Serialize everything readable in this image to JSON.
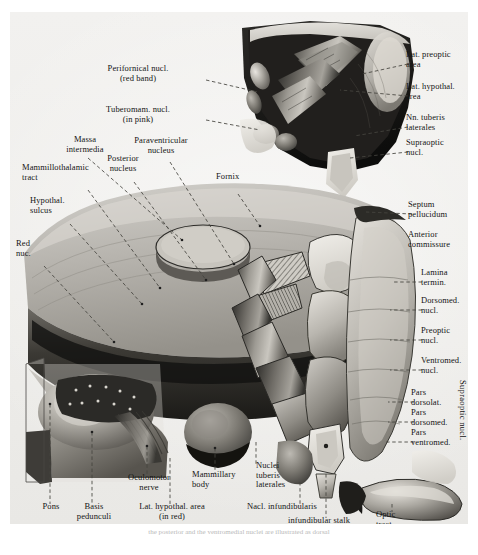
{
  "figure": {
    "type": "anatomical-illustration",
    "rendering": "grayscale halftone",
    "background_color": "#efeeec",
    "ink_color": "#141414",
    "leader_line_color": "#4c4c4c"
  },
  "labels": {
    "top_left_group": [
      {
        "id": "perifornical-nucl",
        "text": "Perifornical nucl.\n(red band)",
        "align": "center",
        "x": 128,
        "y": 62
      },
      {
        "id": "tuberomam-nucl",
        "text": "Tuberomam. nucl.\n(in pink)",
        "align": "center",
        "x": 128,
        "y": 103
      },
      {
        "id": "massa-intermedia",
        "text": "Massa\nintermedia",
        "align": "center",
        "x": 75,
        "y": 133
      },
      {
        "id": "paraventricular-nucleus",
        "text": "Paraventricular\nnucleus",
        "align": "center",
        "x": 151,
        "y": 134
      },
      {
        "id": "posterior-nucleus",
        "text": "Posterior\nnucleus",
        "align": "center",
        "x": 113,
        "y": 152
      },
      {
        "id": "mammillothalamic-tract",
        "text": "Mammillothalamic\ntract",
        "align": "left",
        "x": 22,
        "y": 161
      },
      {
        "id": "fornix",
        "text": "Fornix",
        "align": "left",
        "x": 216,
        "y": 170
      },
      {
        "id": "hypothal-sulcus",
        "text": "Hypothal.\nsulcus",
        "align": "left",
        "x": 30,
        "y": 194
      },
      {
        "id": "red-nucl",
        "text": "Red\nnuc.",
        "align": "left",
        "x": 14,
        "y": 237
      }
    ],
    "top_right_group": [
      {
        "id": "lat-preoptic-area",
        "text": "Lat. preoptic\narea",
        "align": "left",
        "x": 403,
        "y": 48
      },
      {
        "id": "lat-hypothal-area",
        "text": "Lat. hypothal.\narea",
        "align": "left",
        "x": 403,
        "y": 80
      },
      {
        "id": "nn-tuberis-laterales",
        "text": "Nn. tuberis\nlaterales",
        "align": "left",
        "x": 403,
        "y": 111
      },
      {
        "id": "supraoptic-nucl",
        "text": "Supraoptic\nnucl.",
        "align": "left",
        "x": 403,
        "y": 136
      }
    ],
    "right_group": [
      {
        "id": "septum-pellucidum",
        "text": "Septum\npellucidum",
        "align": "left",
        "x": 405,
        "y": 198
      },
      {
        "id": "anterior-commissure",
        "text": "Anterior\ncommissure",
        "align": "left",
        "x": 405,
        "y": 228
      },
      {
        "id": "lamina-termin",
        "text": "Lamina\ntermin.",
        "align": "left",
        "x": 418,
        "y": 266
      },
      {
        "id": "dorsomed-nucl",
        "text": "Dorsomed.\nnucl.",
        "align": "left",
        "x": 418,
        "y": 293
      },
      {
        "id": "preoptic-nucl",
        "text": "Preoptic\nnucl.",
        "align": "left",
        "x": 418,
        "y": 323
      },
      {
        "id": "ventromed-nucl",
        "text": "Ventromed.\nnucl.",
        "align": "left",
        "x": 418,
        "y": 354
      }
    ],
    "lower_right_group": [
      {
        "id": "pars-dorsolat",
        "text": "Pars\ndorsolat.",
        "align": "left",
        "x": 408,
        "y": 386
      },
      {
        "id": "pars-dorsomed",
        "text": "Pars\ndorsomed.",
        "align": "left",
        "x": 408,
        "y": 406
      },
      {
        "id": "pars-ventromed",
        "text": "Pars\nventromed.",
        "align": "left",
        "x": 408,
        "y": 426
      },
      {
        "id": "supraoptic-nucl-vertical",
        "text": "Supraoptic nucl.",
        "orientation": "vertical",
        "x": 464,
        "y": 378
      }
    ],
    "bottom_group": [
      {
        "id": "pons",
        "text": "Pons",
        "align": "center",
        "x": 40,
        "y": 500
      },
      {
        "id": "basis-pedunculi",
        "text": "Basis\npedunculi",
        "align": "center",
        "x": 81,
        "y": 500
      },
      {
        "id": "oculomotor-nerve",
        "text": "Oculomotor\nnerve",
        "align": "center",
        "x": 137,
        "y": 471
      },
      {
        "id": "mammillary-body",
        "text": "Mammillary\nbody",
        "align": "center",
        "x": 205,
        "y": 468
      },
      {
        "id": "lat-hypothal-area-red",
        "text": "Lat. hypothal. area\n(in red)",
        "align": "center",
        "x": 160,
        "y": 500
      },
      {
        "id": "nuclei-tuberis-laterales",
        "text": "Nuclei\ntuberis\nlaterales",
        "align": "left",
        "x": 253,
        "y": 459
      },
      {
        "id": "nucl-infundibularis",
        "text": "Nacl. infundibularis",
        "align": "left",
        "x": 247,
        "y": 500
      },
      {
        "id": "infundibular-stalk",
        "text": "infundibular stalk",
        "align": "left",
        "x": 288,
        "y": 514
      },
      {
        "id": "optic-tract",
        "text": "Optic\ntract",
        "align": "left",
        "x": 376,
        "y": 508
      }
    ]
  },
  "caption": {
    "text": "the posterior and the ventromedial nuclei are illustrated as dorsal"
  }
}
